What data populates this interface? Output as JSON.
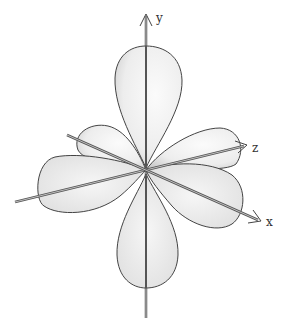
{
  "diagram": {
    "axes": [
      {
        "name": "y",
        "label": "y"
      },
      {
        "name": "z",
        "label": "z"
      },
      {
        "name": "x",
        "label": "x"
      }
    ],
    "colors": {
      "background": "#ffffff",
      "lobe_fill": "#f2f2f2",
      "lobe_shade": "#bdbdbd",
      "outline": "#444444",
      "axis": "#555555"
    }
  }
}
